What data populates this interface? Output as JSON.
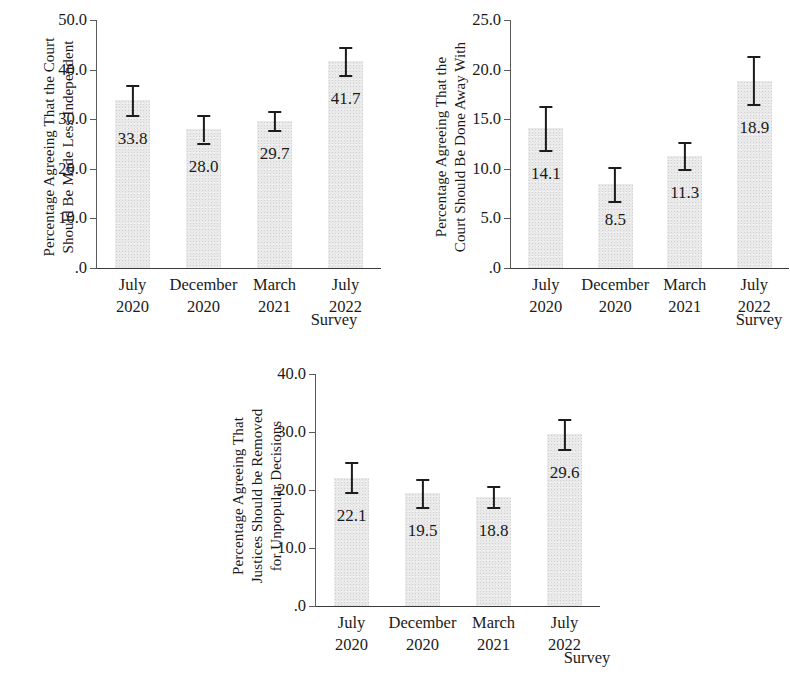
{
  "figure": {
    "kind": "three-panel-bar-chart-with-error-bars",
    "bar_color": "#e9e9e9",
    "error_bar_color": "#1c1c1c",
    "axis_color": "#3a3a3a"
  },
  "chart_data": [
    {
      "type": "bar",
      "panel": 1,
      "title": "",
      "ylabel": "Percentage Agreeing That the Court Should Be Made Less Independent",
      "ylabel_lines": [
        "Percentage Agreeing That the Court",
        "Should Be Made Less Independent"
      ],
      "xlabel": "Survey",
      "categories": [
        "July 2020",
        "December 2020",
        "March 2021",
        "July 2022"
      ],
      "category_lines": [
        [
          "July",
          "2020"
        ],
        [
          "December",
          "2020"
        ],
        [
          "March",
          "2021"
        ],
        [
          "July",
          "2022"
        ]
      ],
      "values": [
        33.8,
        28.0,
        29.7,
        41.7
      ],
      "value_labels": [
        "33.8",
        "28.0",
        "29.7",
        "41.7"
      ],
      "errors_low": [
        30.8,
        25.3,
        27.8,
        39.0
      ],
      "errors_high": [
        36.8,
        30.8,
        31.7,
        44.5
      ],
      "ylim": [
        0,
        50
      ],
      "yticks": [
        0,
        10,
        20,
        30,
        40,
        50
      ],
      "ytick_labels": [
        ".0",
        "10.0",
        "20.0",
        "30.0",
        "40.0",
        "50.0"
      ],
      "grid": false,
      "legend": "none"
    },
    {
      "type": "bar",
      "panel": 2,
      "title": "",
      "ylabel": "Percentage Agreeing That the Court Should Be Done Away With",
      "ylabel_lines": [
        "Percentage Agreeing That the",
        "Court Should Be Done Away With"
      ],
      "xlabel": "Survey",
      "categories": [
        "July 2020",
        "December 2020",
        "March 2021",
        "July 2022"
      ],
      "category_lines": [
        [
          "July",
          "2020"
        ],
        [
          "December",
          "2020"
        ],
        [
          "March",
          "2021"
        ],
        [
          "July",
          "2022"
        ]
      ],
      "values": [
        14.1,
        8.5,
        11.3,
        18.9
      ],
      "value_labels": [
        "14.1",
        "8.5",
        "11.3",
        "18.9"
      ],
      "errors_low": [
        11.9,
        6.8,
        10.0,
        16.5
      ],
      "errors_high": [
        16.3,
        10.2,
        12.7,
        21.4
      ],
      "ylim": [
        0,
        25
      ],
      "yticks": [
        0,
        5,
        10,
        15,
        20,
        25
      ],
      "ytick_labels": [
        ".0",
        "5.0",
        "10.0",
        "15.0",
        "20.0",
        "25.0"
      ],
      "grid": false,
      "legend": "none"
    },
    {
      "type": "bar",
      "panel": 3,
      "title": "",
      "ylabel": "Percentage Agreeing That Justices Should be Removed for Unpopular Decisions",
      "ylabel_lines": [
        "Percentage Agreeing That",
        "Justices Should be Removed",
        "for Unpopular Decisions"
      ],
      "xlabel": "Survey",
      "categories": [
        "July 2020",
        "December 2020",
        "March 2021",
        "July 2022"
      ],
      "category_lines": [
        [
          "July",
          "2020"
        ],
        [
          "December",
          "2020"
        ],
        [
          "March",
          "2021"
        ],
        [
          "July",
          "2022"
        ]
      ],
      "values": [
        22.1,
        19.5,
        18.8,
        29.6
      ],
      "value_labels": [
        "22.1",
        "19.5",
        "18.8",
        "29.6"
      ],
      "errors_low": [
        19.6,
        17.1,
        17.0,
        27.1
      ],
      "errors_high": [
        24.8,
        21.9,
        20.7,
        32.3
      ],
      "ylim": [
        0,
        40
      ],
      "yticks": [
        0,
        10,
        20,
        30,
        40
      ],
      "ytick_labels": [
        ".0",
        "10.0",
        "20.0",
        "30.0",
        "40.0"
      ],
      "grid": false,
      "legend": "none"
    }
  ]
}
